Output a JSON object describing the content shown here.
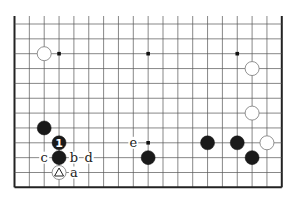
{
  "diagram": {
    "type": "go-board-partial",
    "columns": 19,
    "visible_rows": 12,
    "edges": [
      "left",
      "right",
      "bottom"
    ],
    "star_points": [
      [
        3,
        2
      ],
      [
        9,
        2
      ],
      [
        15,
        2
      ],
      [
        9,
        8
      ]
    ],
    "stones": [
      {
        "color": "white",
        "col": 2,
        "row": 2
      },
      {
        "color": "white",
        "col": 16,
        "row": 3
      },
      {
        "color": "white",
        "col": 16,
        "row": 6
      },
      {
        "color": "white",
        "col": 17,
        "row": 8
      },
      {
        "color": "black",
        "col": 2,
        "row": 7
      },
      {
        "color": "black",
        "col": 3,
        "row": 8,
        "label": "1"
      },
      {
        "color": "black",
        "col": 3,
        "row": 9
      },
      {
        "color": "white",
        "col": 3,
        "row": 10,
        "mark": "triangle"
      },
      {
        "color": "black",
        "col": 9,
        "row": 9
      },
      {
        "color": "black",
        "col": 13,
        "row": 8
      },
      {
        "color": "black",
        "col": 15,
        "row": 8
      },
      {
        "color": "black",
        "col": 16,
        "row": 9
      }
    ],
    "labels": [
      {
        "text": "c",
        "col": 2,
        "row": 9
      },
      {
        "text": "b",
        "col": 4,
        "row": 9
      },
      {
        "text": "d",
        "col": 5,
        "row": 9
      },
      {
        "text": "a",
        "col": 4,
        "row": 10
      },
      {
        "text": "e",
        "col": 8,
        "row": 8
      }
    ],
    "colors": {
      "line": "#555555",
      "edge": "#222222",
      "black_stone": "#1a1a1a",
      "white_stone": "#ffffff"
    }
  }
}
